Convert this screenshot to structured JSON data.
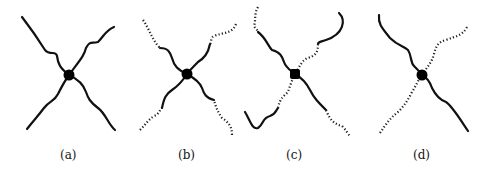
{
  "figure": {
    "panels": [
      {
        "id": "a",
        "label": "(a)",
        "description": "four solid arms"
      },
      {
        "id": "b",
        "label": "(b)",
        "description": "four arms, solid near core, dotted at ends"
      },
      {
        "id": "c",
        "label": "(c)",
        "description": "mixed solid and dotted arms"
      },
      {
        "id": "d",
        "label": "(d)",
        "description": "two solid arms, two dotted arms"
      }
    ]
  }
}
